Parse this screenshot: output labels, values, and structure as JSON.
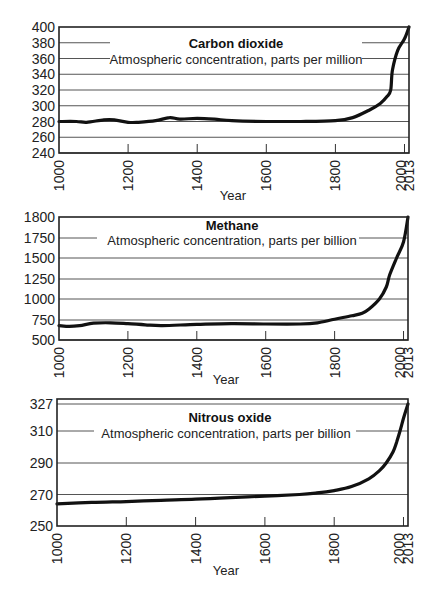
{
  "chart_data": [
    {
      "type": "line",
      "title": "Carbon dioxide",
      "subtitle": "Atmospheric concentration, parts per million",
      "xlabel": "Year",
      "ylabel": "",
      "xticks": [
        1000,
        1200,
        1400,
        1600,
        1800,
        2000,
        2013
      ],
      "yticks": [
        240,
        260,
        280,
        300,
        320,
        340,
        360,
        380,
        400
      ],
      "ylim": [
        240,
        400
      ],
      "xlim": [
        1000,
        2013
      ],
      "grid": true,
      "legend": null,
      "series": [
        {
          "name": "Carbon dioxide (ppm)",
          "x": [
            1000,
            1050,
            1080,
            1130,
            1160,
            1200,
            1230,
            1280,
            1320,
            1350,
            1400,
            1450,
            1500,
            1600,
            1700,
            1800,
            1850,
            1900,
            1930,
            1950,
            1960,
            1965,
            1980,
            2000,
            2013
          ],
          "y": [
            280,
            280,
            279,
            282,
            282,
            279,
            279,
            281,
            285,
            283,
            284,
            283,
            281,
            280,
            280,
            281,
            285,
            295,
            303,
            312,
            320,
            345,
            370,
            385,
            400
          ]
        }
      ]
    },
    {
      "type": "line",
      "title": "Methane",
      "subtitle": "Atmospheric concentration, parts per billion",
      "xlabel": "Year",
      "ylabel": "",
      "xticks": [
        1000,
        1200,
        1400,
        1600,
        1800,
        2000,
        2013
      ],
      "yticks": [
        500,
        750,
        1000,
        1250,
        1500,
        1750,
        1800
      ],
      "ylim": [
        500,
        1800
      ],
      "xlim": [
        1000,
        2013
      ],
      "grid": true,
      "legend": null,
      "series": [
        {
          "name": "Methane (ppb)",
          "x": [
            1000,
            1030,
            1060,
            1100,
            1150,
            1200,
            1250,
            1300,
            1400,
            1500,
            1600,
            1700,
            1750,
            1800,
            1850,
            1880,
            1900,
            1930,
            1950,
            1960,
            1980,
            2000,
            2013
          ],
          "y": [
            680,
            670,
            680,
            710,
            715,
            705,
            690,
            680,
            695,
            705,
            700,
            700,
            715,
            760,
            800,
            830,
            880,
            1000,
            1150,
            1300,
            1500,
            1700,
            1800
          ]
        }
      ]
    },
    {
      "type": "line",
      "title": "Nitrous oxide",
      "subtitle": "Atmospheric concentration, parts per billion",
      "xlabel": "Year",
      "ylabel": "",
      "xticks": [
        1000,
        1200,
        1400,
        1600,
        1800,
        2000,
        2013
      ],
      "yticks": [
        250,
        270,
        290,
        310,
        327
      ],
      "ylim": [
        250,
        330
      ],
      "xlim": [
        1000,
        2013
      ],
      "grid": true,
      "legend": null,
      "series": [
        {
          "name": "Nitrous oxide (ppb)",
          "x": [
            1000,
            1100,
            1200,
            1300,
            1400,
            1500,
            1600,
            1700,
            1750,
            1800,
            1850,
            1900,
            1930,
            1950,
            1970,
            1980,
            1990,
            2000,
            2013
          ],
          "y": [
            264,
            265,
            265.5,
            266.3,
            267,
            268,
            269,
            270,
            271,
            272.5,
            275,
            280,
            285,
            290,
            297,
            303,
            310,
            318,
            327
          ]
        }
      ]
    }
  ],
  "charts": [
    {
      "title": "Carbon dioxide",
      "subtitle": "Atmospheric concentration, parts per million",
      "xlabel": "Year",
      "ytick_labels": [
        "400",
        "380",
        "360",
        "340",
        "320",
        "300",
        "280",
        "260",
        "240"
      ],
      "xtick_labels": [
        "1000",
        "1200",
        "1400",
        "1600",
        "1800",
        "2000",
        "2013"
      ]
    },
    {
      "title": "Methane",
      "subtitle": "Atmospheric concentration, parts per billion",
      "xlabel": "Year",
      "ytick_labels": [
        "1800",
        "1750",
        "1500",
        "1250",
        "1000",
        "750",
        "500"
      ],
      "xtick_labels": [
        "1000",
        "1200",
        "1400",
        "1600",
        "1800",
        "2000",
        "2013"
      ]
    },
    {
      "title": "Nitrous oxide",
      "subtitle": "Atmospheric concentration, parts per billion",
      "xlabel": "Year",
      "ytick_labels": [
        "327",
        "310",
        "290",
        "270",
        "250"
      ],
      "xtick_labels": [
        "1000",
        "1200",
        "1400",
        "1600",
        "1800",
        "2000",
        "2013"
      ]
    }
  ]
}
